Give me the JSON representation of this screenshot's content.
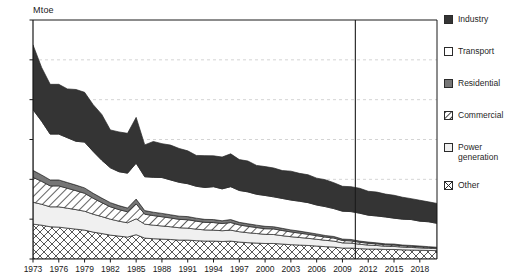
{
  "chart_data": {
    "type": "area",
    "title": "",
    "xlabel": "",
    "ylabel": "Mtoe",
    "ylim": [
      0,
      120
    ],
    "ytick_labels": [
      "0",
      "20",
      "40",
      "60",
      "80",
      "100",
      "120"
    ],
    "ytick_values": [
      0,
      20,
      40,
      60,
      80,
      100,
      120
    ],
    "xlim": [
      1973,
      2020
    ],
    "xtick_labels": [
      "1973",
      "1976",
      "1979",
      "1982",
      "1985",
      "1988",
      "1991",
      "1994",
      "1997",
      "2000",
      "2003",
      "2006",
      "2009",
      "2012",
      "2015",
      "2018"
    ],
    "xtick_values": [
      1973,
      1976,
      1979,
      1982,
      1985,
      1988,
      1991,
      1994,
      1997,
      2000,
      2003,
      2006,
      2009,
      2012,
      2015,
      2018
    ],
    "grid": "horizontal-dashed",
    "legend_position": "right",
    "stacking_order_bottom_to_top": [
      "Other",
      "Power generation",
      "Commercial",
      "Residential",
      "Transport",
      "Industry"
    ],
    "annotations": [
      {
        "type": "vertical-line",
        "x": 2010.5,
        "label": ""
      }
    ],
    "years": [
      1973,
      1974,
      1975,
      1976,
      1977,
      1978,
      1979,
      1980,
      1981,
      1982,
      1983,
      1984,
      1985,
      1986,
      1987,
      1988,
      1989,
      1990,
      1991,
      1992,
      1993,
      1994,
      1995,
      1996,
      1997,
      1998,
      1999,
      2000,
      2001,
      2002,
      2003,
      2004,
      2005,
      2006,
      2007,
      2008,
      2009,
      2010,
      2011,
      2012,
      2013,
      2014,
      2015,
      2016,
      2017,
      2018,
      2019,
      2020
    ],
    "series": [
      {
        "name": "Other",
        "pattern": "cross-hatch",
        "values": [
          17.5,
          17.0,
          16.2,
          16.0,
          15.5,
          15.0,
          14.5,
          13.5,
          12.8,
          12.0,
          11.5,
          11.0,
          12.2,
          10.5,
          10.2,
          10.0,
          9.8,
          9.5,
          9.5,
          9.2,
          9.0,
          9.0,
          8.8,
          9.0,
          8.5,
          8.2,
          8.0,
          7.8,
          7.8,
          7.5,
          7.2,
          7.0,
          6.8,
          6.5,
          6.2,
          6.0,
          5.5,
          5.5,
          5.2,
          5.0,
          5.0,
          4.8,
          4.8,
          4.6,
          4.5,
          4.4,
          4.3,
          4.2
        ]
      },
      {
        "name": "Power generation",
        "pattern": "light-gray",
        "values": [
          11.0,
          10.5,
          10.0,
          10.2,
          10.0,
          9.8,
          9.5,
          9.0,
          8.5,
          8.0,
          7.5,
          7.2,
          8.0,
          7.0,
          6.8,
          6.6,
          6.4,
          6.2,
          6.0,
          5.8,
          5.6,
          5.5,
          5.4,
          5.5,
          5.2,
          5.0,
          4.8,
          4.6,
          4.5,
          4.2,
          4.0,
          3.8,
          3.6,
          3.4,
          3.2,
          3.0,
          2.6,
          2.5,
          2.2,
          2.0,
          1.8,
          1.6,
          1.5,
          1.4,
          1.3,
          1.2,
          1.1,
          1.0
        ]
      },
      {
        "name": "Commercial",
        "pattern": "diagonal-hatch",
        "values": [
          12.5,
          11.5,
          10.5,
          10.5,
          10.0,
          9.5,
          9.0,
          8.0,
          7.0,
          6.2,
          5.8,
          5.5,
          7.5,
          5.0,
          4.8,
          4.6,
          4.4,
          4.2,
          4.2,
          4.0,
          3.8,
          3.8,
          3.6,
          3.8,
          3.4,
          3.2,
          3.0,
          2.8,
          2.8,
          2.6,
          2.4,
          2.2,
          2.0,
          1.8,
          1.6,
          1.5,
          1.2,
          1.1,
          1.0,
          0.9,
          0.8,
          0.7,
          0.7,
          0.6,
          0.6,
          0.5,
          0.5,
          0.4
        ]
      },
      {
        "name": "Residential",
        "pattern": "mid-gray",
        "values": [
          3.5,
          3.2,
          3.0,
          3.0,
          2.9,
          2.8,
          2.7,
          2.5,
          2.3,
          2.1,
          2.0,
          1.9,
          2.4,
          1.8,
          1.7,
          1.7,
          1.6,
          1.6,
          1.6,
          1.5,
          1.5,
          1.5,
          1.4,
          1.5,
          1.3,
          1.3,
          1.2,
          1.2,
          1.1,
          1.1,
          1.0,
          1.0,
          0.9,
          0.9,
          0.8,
          0.8,
          0.7,
          0.7,
          0.6,
          0.6,
          0.5,
          0.5,
          0.5,
          0.4,
          0.4,
          0.4,
          0.3,
          0.3
        ]
      },
      {
        "name": "Transport",
        "pattern": "white",
        "values": [
          30.5,
          27.0,
          23.0,
          23.0,
          22.5,
          22.0,
          23.0,
          21.0,
          19.0,
          17.5,
          17.0,
          17.5,
          18.0,
          17.0,
          17.5,
          18.0,
          17.5,
          17.0,
          16.5,
          16.0,
          16.0,
          16.5,
          16.0,
          16.5,
          16.0,
          16.0,
          15.5,
          15.5,
          15.0,
          15.0,
          15.0,
          15.0,
          15.0,
          14.5,
          14.5,
          14.0,
          14.0,
          14.0,
          14.0,
          13.5,
          13.5,
          13.5,
          13.0,
          13.0,
          13.0,
          12.5,
          12.5,
          12.0
        ]
      },
      {
        "name": "Industry",
        "pattern": "dark",
        "values": [
          32.5,
          27.0,
          25.0,
          25.0,
          24.5,
          26.0,
          25.0,
          23.5,
          23.0,
          19.0,
          20.0,
          20.0,
          23.0,
          16.0,
          18.0,
          17.0,
          17.5,
          17.0,
          16.5,
          15.5,
          16.0,
          15.5,
          16.0,
          16.5,
          15.5,
          15.5,
          14.5,
          14.5,
          14.5,
          14.0,
          14.5,
          14.0,
          14.0,
          13.5,
          13.5,
          13.0,
          12.5,
          12.5,
          12.5,
          12.0,
          12.0,
          11.5,
          11.5,
          11.0,
          10.5,
          10.5,
          10.0,
          10.0
        ]
      }
    ]
  },
  "legend": {
    "items": [
      {
        "label": "Industry",
        "swatch": "industry-swatch"
      },
      {
        "label": "Transport",
        "swatch": "transport-swatch"
      },
      {
        "label": "Residential",
        "swatch": "residential-swatch"
      },
      {
        "label": "Commercial",
        "swatch": "commercial-swatch"
      },
      {
        "label": "Power\ngeneration",
        "swatch": "power-generation-swatch"
      },
      {
        "label": "Other",
        "swatch": "other-swatch"
      }
    ]
  },
  "colors": {
    "industry": "#343434",
    "transport": "#ffffff",
    "residential": "#767676",
    "commercial": "#ffffff",
    "power_generation": "#f0f0f0",
    "other": "#ffffff",
    "axis": "#1a1a1a",
    "grid": "#c9c9c9"
  }
}
